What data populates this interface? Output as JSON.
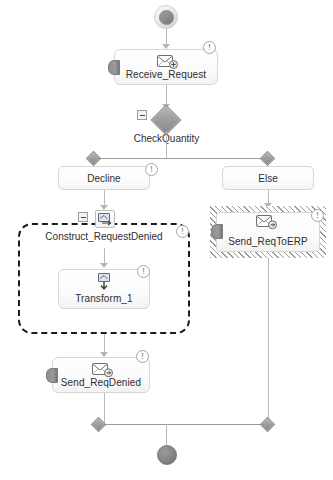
{
  "diagram": {
    "type": "bpmn-workflow",
    "background": "#ffffff",
    "accent_gray": "#9a9a9a"
  },
  "nodes": {
    "start": {
      "name": "start-event",
      "label": ""
    },
    "receive_request": {
      "label": "Receive_Request",
      "icon": "receive-message-icon",
      "badge": "!",
      "has_inbound_pin": true
    },
    "check_quantity": {
      "label": "CheckQuantity",
      "icon": "gateway-diamond-icon",
      "collapse": "-"
    },
    "branch_decline": {
      "label": "Decline",
      "badge": "!"
    },
    "branch_else": {
      "label": "Else"
    },
    "construct_request_denied": {
      "label": "Construct_RequestDenied",
      "icon": "transform-subprocess-icon",
      "badge": "!",
      "collapse": "-"
    },
    "transform_1": {
      "label": "Transform_1",
      "icon": "transform-icon",
      "badge": "!"
    },
    "send_req_denied": {
      "label": "Send_ReqDenied",
      "icon": "send-message-icon",
      "badge": "!",
      "has_inbound_pin": true
    },
    "send_req_to_erp": {
      "label": "Send_ReqToERP",
      "icon": "send-message-icon",
      "badge": "!",
      "has_inbound_pin": true,
      "highlight": "hatched"
    },
    "end": {
      "name": "end-event",
      "label": ""
    }
  }
}
